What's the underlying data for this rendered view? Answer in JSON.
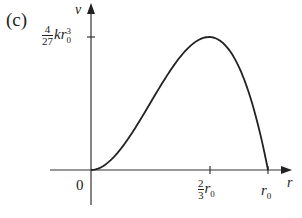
{
  "panel_label": "(c)",
  "axes": {
    "y_label": "v",
    "x_label": "r",
    "origin_label": "0"
  },
  "y_tick": {
    "numerator": "4",
    "denominator": "27",
    "expr": "kr",
    "sub": "0",
    "sup": "3"
  },
  "x_ticks": [
    {
      "numerator": "2",
      "denominator": "3",
      "expr": "r",
      "sub": "0"
    },
    {
      "expr": "r",
      "sub": "0"
    }
  ],
  "curve": {
    "description": "v = k r^2 (r0 - r), zero at r=0 and r=r0, maximum 4/27 k r0^3 at r=2/3 r0",
    "color": "#222222"
  }
}
